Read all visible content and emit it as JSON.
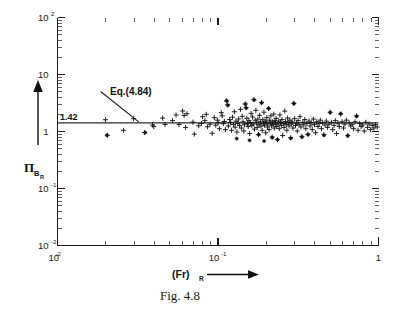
{
  "figure": {
    "caption": "Fig. 4.8",
    "background_color": "#ffffff",
    "ink_color": "#111111"
  },
  "chart_data": {
    "type": "scatter",
    "title": "",
    "subtitle": "",
    "xlabel": "(Fr)R",
    "xlabel_base": "(Fr)",
    "xlabel_subscript": "R",
    "ylabel": "ΠBR",
    "ylabel_base": "Π",
    "ylabel_subscript": "B",
    "ylabel_subsubscript": "R",
    "xscale": "log",
    "yscale": "log",
    "xlim": [
      0.01,
      1.0
    ],
    "ylim": [
      0.01,
      100.0
    ],
    "grid": false,
    "legend": "none",
    "x_ticks": [
      {
        "value": 0.01,
        "base": "10",
        "exponent": "-2"
      },
      {
        "value": 0.1,
        "base": "10",
        "exponent": "-1"
      },
      {
        "value": 1.0,
        "base": "1",
        "exponent": ""
      }
    ],
    "y_ticks": [
      {
        "value": 100.0,
        "base": "10",
        "exponent": "2"
      },
      {
        "value": 10.0,
        "base": "10",
        "exponent": ""
      },
      {
        "value": 1.0,
        "base": "1",
        "exponent": ""
      },
      {
        "value": 0.1,
        "base": "10",
        "exponent": "-1"
      },
      {
        "value": 0.01,
        "base": "10",
        "exponent": "-2"
      }
    ],
    "reference_lines": [
      {
        "name": "Eq.(4.84)",
        "orientation": "horizontal",
        "y_value": 1.42,
        "label": "1.42",
        "annotation": "Eq.(4.84)"
      }
    ],
    "annotations": [
      {
        "text": "Eq.(4.84)",
        "points_to_y": 1.42,
        "points_to_x": 0.027
      }
    ],
    "series": [
      {
        "name": "data-plus",
        "marker": "plus",
        "points": [
          [
            0.0199,
            1.61
          ],
          [
            0.0205,
            0.86
          ],
          [
            0.0258,
            1.05
          ],
          [
            0.0298,
            1.68
          ],
          [
            0.0348,
            0.96
          ],
          [
            0.0391,
            1.3
          ],
          [
            0.0398,
            1.22
          ],
          [
            0.0452,
            1.72
          ],
          [
            0.0468,
            1.33
          ],
          [
            0.0521,
            1.55
          ],
          [
            0.0548,
            1.95
          ],
          [
            0.0572,
            1.33
          ],
          [
            0.0602,
            2.29
          ],
          [
            0.0615,
            1.91
          ],
          [
            0.0628,
            1.18
          ],
          [
            0.0641,
            2.05
          ],
          [
            0.0698,
            1.46
          ],
          [
            0.0712,
            0.9
          ],
          [
            0.0758,
            1.26
          ],
          [
            0.0788,
            1.38
          ],
          [
            0.0802,
            1.82
          ],
          [
            0.0828,
            1.55
          ],
          [
            0.0845,
            2.0
          ],
          [
            0.0861,
            1.21
          ],
          [
            0.0892,
            1.34
          ],
          [
            0.0921,
            0.93
          ],
          [
            0.0948,
            1.75
          ],
          [
            0.0968,
            1.29
          ],
          [
            0.0991,
            1.58
          ],
          [
            0.1002,
            1.42
          ],
          [
            0.1021,
            1.12
          ],
          [
            0.1048,
            2.14
          ],
          [
            0.1062,
            1.88
          ],
          [
            0.1079,
            1.37
          ],
          [
            0.1095,
            1.5
          ],
          [
            0.1112,
            1.08
          ],
          [
            0.1128,
            3.41
          ],
          [
            0.1148,
            2.95
          ],
          [
            0.1161,
            1.25
          ],
          [
            0.1182,
            1.62
          ],
          [
            0.1198,
            1.45
          ],
          [
            0.1215,
            1.05
          ],
          [
            0.1232,
            1.78
          ],
          [
            0.1248,
            1.33
          ],
          [
            0.1265,
            2.22
          ],
          [
            0.1278,
            1.19
          ],
          [
            0.1295,
            1.52
          ],
          [
            0.1312,
            0.98
          ],
          [
            0.1328,
            1.4
          ],
          [
            0.1345,
            1.66
          ],
          [
            0.1362,
            1.28
          ],
          [
            0.1382,
            2.45
          ],
          [
            0.1398,
            1.15
          ],
          [
            0.1415,
            1.85
          ],
          [
            0.1432,
            1.48
          ],
          [
            0.1448,
            1.02
          ],
          [
            0.1462,
            1.31
          ],
          [
            0.1478,
            3.05
          ],
          [
            0.1495,
            2.62
          ],
          [
            0.1512,
            1.71
          ],
          [
            0.1528,
            1.38
          ],
          [
            0.1542,
            1.22
          ],
          [
            0.1558,
            1.55
          ],
          [
            0.1575,
            0.92
          ],
          [
            0.1592,
            1.44
          ],
          [
            0.1608,
            2.08
          ],
          [
            0.1625,
            1.27
          ],
          [
            0.1642,
            1.8
          ],
          [
            0.1658,
            1.35
          ],
          [
            0.1672,
            3.62
          ],
          [
            0.1688,
            1.1
          ],
          [
            0.1705,
            1.58
          ],
          [
            0.1722,
            2.35
          ],
          [
            0.1738,
            1.42
          ],
          [
            0.1755,
            1.18
          ],
          [
            0.1772,
            1.65
          ],
          [
            0.1788,
            0.88
          ],
          [
            0.1802,
            1.32
          ],
          [
            0.1818,
            1.92
          ],
          [
            0.1835,
            1.48
          ],
          [
            0.1852,
            1.24
          ],
          [
            0.1868,
            3.22
          ],
          [
            0.1885,
            1.05
          ],
          [
            0.1902,
            1.61
          ],
          [
            0.1918,
            1.38
          ],
          [
            0.1932,
            2.18
          ],
          [
            0.1948,
            1.29
          ],
          [
            0.1965,
            1.52
          ],
          [
            0.1982,
            0.95
          ],
          [
            0.1998,
            1.45
          ],
          [
            0.2015,
            1.75
          ],
          [
            0.2032,
            1.2
          ],
          [
            0.2048,
            1.36
          ],
          [
            0.2065,
            2.52
          ],
          [
            0.2082,
            1.08
          ],
          [
            0.2098,
            1.58
          ],
          [
            0.2118,
            1.42
          ],
          [
            0.2135,
            1.88
          ],
          [
            0.2152,
            1.26
          ],
          [
            0.2172,
            0.8
          ],
          [
            0.2188,
            1.48
          ],
          [
            0.2205,
            1.33
          ],
          [
            0.2225,
            2.02
          ],
          [
            0.2242,
            1.15
          ],
          [
            0.2262,
            1.55
          ],
          [
            0.2282,
            1.4
          ],
          [
            0.2302,
            1.7
          ],
          [
            0.2322,
            1.22
          ],
          [
            0.2345,
            0.72
          ],
          [
            0.2365,
            1.35
          ],
          [
            0.2388,
            1.52
          ],
          [
            0.2408,
            1.12
          ],
          [
            0.2432,
            1.95
          ],
          [
            0.2455,
            1.44
          ],
          [
            0.2478,
            1.28
          ],
          [
            0.2502,
            1.62
          ],
          [
            0.2528,
            0.85
          ],
          [
            0.2552,
            1.38
          ],
          [
            0.2578,
            1.18
          ],
          [
            0.2605,
            2.28
          ],
          [
            0.2632,
            1.5
          ],
          [
            0.2658,
            1.32
          ],
          [
            0.2685,
            1.05
          ],
          [
            0.2715,
            1.72
          ],
          [
            0.2742,
            1.42
          ],
          [
            0.2772,
            1.25
          ],
          [
            0.2802,
            1.58
          ],
          [
            0.2835,
            0.78
          ],
          [
            0.2865,
            1.35
          ],
          [
            0.2898,
            1.48
          ],
          [
            0.2932,
            1.15
          ],
          [
            0.2968,
            3.12
          ],
          [
            0.3002,
            1.68
          ],
          [
            0.3042,
            1.28
          ],
          [
            0.3078,
            1.4
          ],
          [
            0.3118,
            1.02
          ],
          [
            0.3158,
            1.55
          ],
          [
            0.3198,
            1.32
          ],
          [
            0.3242,
            1.82
          ],
          [
            0.3285,
            1.2
          ],
          [
            0.3332,
            0.82
          ],
          [
            0.3378,
            1.45
          ],
          [
            0.3425,
            1.3
          ],
          [
            0.3472,
            1.62
          ],
          [
            0.3525,
            1.12
          ],
          [
            0.3578,
            1.38
          ],
          [
            0.3632,
            0.9
          ],
          [
            0.3688,
            1.52
          ],
          [
            0.3745,
            1.25
          ],
          [
            0.3805,
            1.42
          ],
          [
            0.3865,
            1.08
          ],
          [
            0.3928,
            1.65
          ],
          [
            0.3992,
            1.32
          ],
          [
            0.4058,
            0.95
          ],
          [
            0.4125,
            1.48
          ],
          [
            0.4195,
            1.22
          ],
          [
            0.4265,
            1.38
          ],
          [
            0.4338,
            1.58
          ],
          [
            0.4412,
            1.12
          ],
          [
            0.4488,
            1.42
          ],
          [
            0.4568,
            0.88
          ],
          [
            0.4648,
            1.3
          ],
          [
            0.4732,
            1.52
          ],
          [
            0.4818,
            1.18
          ],
          [
            0.4905,
            1.35
          ],
          [
            0.4995,
            2.18
          ],
          [
            0.5088,
            1.45
          ],
          [
            0.5182,
            1.08
          ],
          [
            0.5282,
            1.28
          ],
          [
            0.5382,
            1.55
          ],
          [
            0.5485,
            0.92
          ],
          [
            0.5592,
            1.4
          ],
          [
            0.5702,
            1.22
          ],
          [
            0.5815,
            2.02
          ],
          [
            0.5932,
            1.48
          ],
          [
            0.6052,
            1.15
          ],
          [
            0.6175,
            1.35
          ],
          [
            0.6302,
            1.58
          ],
          [
            0.6432,
            0.85
          ],
          [
            0.6568,
            1.42
          ],
          [
            0.6705,
            1.25
          ],
          [
            0.6848,
            1.32
          ],
          [
            0.6995,
            1.12
          ],
          [
            0.7145,
            1.48
          ],
          [
            0.7302,
            1.88
          ],
          [
            0.7462,
            1.05
          ],
          [
            0.7628,
            1.38
          ],
          [
            0.7798,
            1.22
          ],
          [
            0.7975,
            1.3
          ],
          [
            0.8155,
            1.02
          ],
          [
            0.8342,
            1.45
          ],
          [
            0.8535,
            1.18
          ],
          [
            0.8732,
            1.35
          ],
          [
            0.8938,
            1.08
          ],
          [
            0.9148,
            1.28
          ],
          [
            0.9365,
            1.15
          ],
          [
            0.9588,
            1.32
          ],
          [
            0.9818,
            1.2
          ]
        ]
      },
      {
        "name": "data-star",
        "marker": "star",
        "points": [
          [
            0.0203,
            0.86
          ],
          [
            0.0352,
            0.96
          ],
          [
            0.1132,
            3.48
          ],
          [
            0.1152,
            2.88
          ],
          [
            0.1308,
            0.75
          ],
          [
            0.1482,
            3.02
          ],
          [
            0.1498,
            2.58
          ],
          [
            0.1572,
            0.7
          ],
          [
            0.1678,
            3.58
          ],
          [
            0.1792,
            0.88
          ],
          [
            0.1872,
            3.18
          ],
          [
            0.1938,
            0.68
          ],
          [
            0.2068,
            2.55
          ],
          [
            0.2178,
            0.78
          ],
          [
            0.2348,
            0.72
          ],
          [
            0.2842,
            0.76
          ],
          [
            0.2972,
            3.08
          ],
          [
            0.3338,
            0.8
          ],
          [
            0.3635,
            0.88
          ],
          [
            0.4572,
            0.86
          ],
          [
            0.5002,
            2.15
          ],
          [
            0.5818,
            2.05
          ],
          [
            0.6438,
            0.84
          ],
          [
            0.7305,
            1.85
          ]
        ]
      }
    ]
  },
  "labels": {
    "ref_value": "1.42",
    "equation_annotation": "Eq.(4.84)",
    "caption": "Fig. 4.8"
  }
}
